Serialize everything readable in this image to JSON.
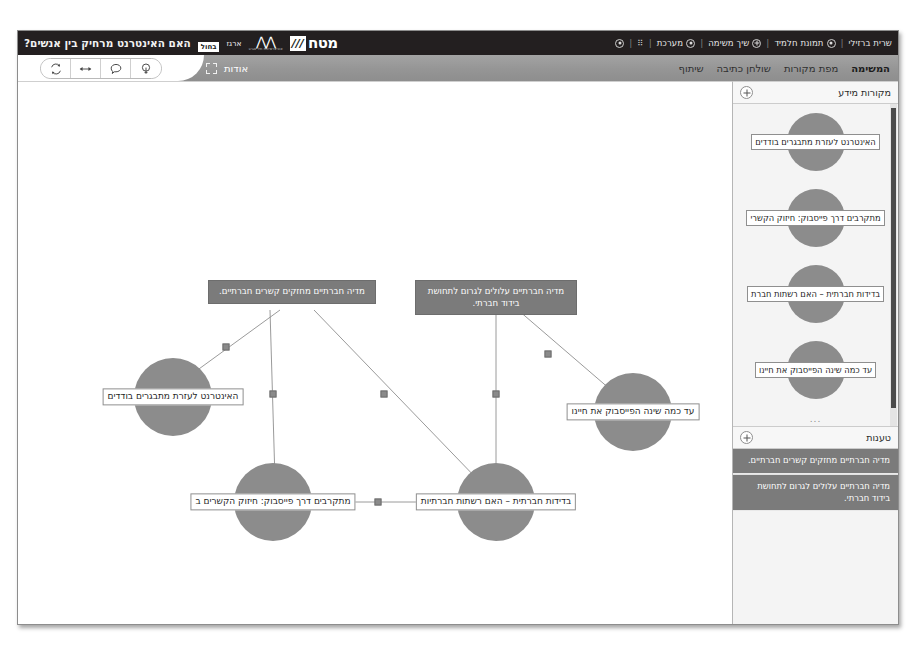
{
  "window": {
    "topbar": {
      "left_menu": [
        {
          "label": "שרית ברזילי",
          "icon": ""
        },
        {
          "label": "תמונת חלמיד",
          "icon": "user-icon"
        },
        {
          "label": "שיך משימה",
          "icon": "plus-circle-icon"
        },
        {
          "label": "מערכת",
          "icon": "gear-icon"
        },
        {
          "label": "",
          "icon": "dots-icon"
        },
        {
          "label": "",
          "icon": "power-icon"
        }
      ],
      "separator": "|",
      "brand": {
        "title": "האם האינטרנט מרחיק בין אנשים?",
        "badge_white": "בחול",
        "badge_label": "ארגז",
        "logo_word": "מטח",
        "logo_mark": "///",
        "logo_sub": "המרכז לטכנולוגיה חינוכית",
        "partner_sub": "אוניברסיטת תל אביב"
      }
    },
    "nav": {
      "about_label": "אודות",
      "about_icon": "expand-brackets-icon",
      "tabs": [
        {
          "label": "שיתוף",
          "active": false
        },
        {
          "label": "שולחן כתיבה",
          "active": false
        },
        {
          "label": "מפת מקורות",
          "active": true
        },
        {
          "label": "המשימה",
          "active": false
        }
      ],
      "toolbar": [
        {
          "name": "refresh-icon"
        },
        {
          "name": "resize-arrows-icon"
        },
        {
          "name": "comment-icon"
        },
        {
          "name": "lightbulb-icon"
        }
      ]
    },
    "canvas": {
      "claims": [
        {
          "id": "claim-1",
          "text": "מדיה חברתיים מחזקים קשרים חברתיים.",
          "x": 274,
          "y": 198,
          "width": 168
        },
        {
          "id": "claim-2",
          "text": "מדיה חברתיים עלולים לגרום לתחושת בידוד חברתי.",
          "x": 478,
          "y": 198,
          "width": 162
        }
      ],
      "nodes": [
        {
          "id": "node-1",
          "label": "האינטרנט לעזרת מתבגרים בודדים",
          "x": 155,
          "y": 315
        },
        {
          "id": "node-2",
          "label": "מתקרבים דרך פייסבוק: חיזוק הקשרים ב",
          "x": 255,
          "y": 420
        },
        {
          "id": "node-3",
          "label": "בדידות חברתית – האם רשתות חברתיות",
          "x": 478,
          "y": 420
        },
        {
          "id": "node-4",
          "label": "עד כמה שינה הפייסבוק את חיינו",
          "x": 615,
          "y": 330
        }
      ],
      "edges": [
        {
          "from": "claim-1",
          "to": "node-1",
          "marker_x": 208,
          "marker_y": 265
        },
        {
          "from": "claim-1",
          "to": "node-2",
          "marker_x": 249,
          "marker_y": 312
        },
        {
          "from": "claim-1",
          "to": "node-3",
          "marker_x": 362,
          "marker_y": 312
        },
        {
          "from": "claim-2",
          "to": "node-3",
          "marker_x": 477,
          "marker_y": 310
        },
        {
          "from": "claim-2",
          "to": "node-4",
          "marker_x": 530,
          "marker_y": 272
        },
        {
          "from": "node-2",
          "to": "node-3",
          "marker_x": 357,
          "marker_y": 420
        }
      ]
    },
    "sidebar": {
      "sources_panel": {
        "title": "מקורות מידע",
        "add_label": "+",
        "ellipsis": "...",
        "items": [
          {
            "label": "האינטרנט לעזרת מתבגרים בודדים"
          },
          {
            "label": "מתקרבים דרך פייסבוק: חיזוק הקשרי"
          },
          {
            "label": "בדידות חברתית – האם רשתות חברת"
          },
          {
            "label": "עד כמה שינה הפייסבוק את חיינו"
          }
        ]
      },
      "claims_panel": {
        "title": "טענות",
        "add_label": "+",
        "items": [
          {
            "text": "מדיה חברתיים מחזקים קשרים חברתיים."
          },
          {
            "text": "מדיה חברתיים עלולים לגרום לתחושת בידוד חברתי."
          }
        ]
      }
    },
    "colors": {
      "topbar_bg": "#231f20",
      "nav_bg": "#9b9b9b",
      "node_fill": "#8c8c8c",
      "claim_fill": "#7b7b7b",
      "sidebar_bg": "#f3f3f3",
      "edge_stroke": "#8f8f8f"
    }
  }
}
